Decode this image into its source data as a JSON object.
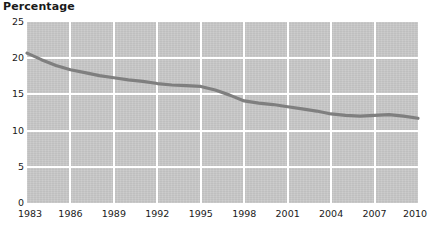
{
  "chart_data": {
    "type": "line",
    "title": "Percentage",
    "subtitle": "",
    "xlabel": "",
    "ylabel": "Percentage",
    "xlim": [
      1983,
      2010
    ],
    "ylim": [
      0,
      25
    ],
    "ytick_labels": [
      "25",
      "20",
      "15",
      "10",
      "5",
      "0"
    ],
    "ytick_values": [
      25,
      20,
      15,
      10,
      5,
      0
    ],
    "xtick_labels": [
      "1983",
      "1986",
      "1989",
      "1992",
      "1995",
      "1998",
      "2001",
      "2004",
      "2007",
      "2010"
    ],
    "xtick_values": [
      1983,
      1986,
      1989,
      1992,
      1995,
      1998,
      2001,
      2004,
      2007,
      2010
    ],
    "grid": true,
    "grid_color": "#ffffff",
    "plot_background": "#c7c7c7",
    "legend": "none",
    "series": [
      {
        "name": "Percentage",
        "color": "#7f7f7f",
        "x": [
          1983,
          1984,
          1985,
          1986,
          1987,
          1988,
          1989,
          1990,
          1991,
          1992,
          1993,
          1994,
          1995,
          1996,
          1997,
          1998,
          1999,
          2000,
          2001,
          2002,
          2003,
          2004,
          2005,
          2006,
          2007,
          2008,
          2009,
          2010
        ],
        "values": [
          20.7,
          19.8,
          19.0,
          18.4,
          18.0,
          17.6,
          17.3,
          17.0,
          16.8,
          16.5,
          16.3,
          16.2,
          16.1,
          15.6,
          14.9,
          14.1,
          13.8,
          13.6,
          13.3,
          13.0,
          12.7,
          12.3,
          12.1,
          12.0,
          12.1,
          12.2,
          12.0,
          11.7
        ]
      }
    ]
  }
}
